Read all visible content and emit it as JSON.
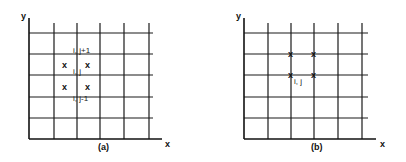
{
  "panel_a": {
    "caption": "(a)",
    "x_axis_label": "x",
    "y_axis_label": "y",
    "node_labels": {
      "top": "i, j+1",
      "middle": "i, j",
      "bottom": "i, j-1"
    },
    "marker": "x"
  },
  "panel_b": {
    "caption": "(b)",
    "x_axis_label": "x",
    "y_axis_label": "y",
    "node_label": "i, j",
    "marker": "x"
  }
}
